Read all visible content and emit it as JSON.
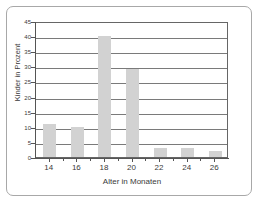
{
  "chart_data": {
    "type": "bar",
    "title": "",
    "xlabel": "Alter in Monaten",
    "ylabel": "Kinder in Prozent",
    "categories": [
      "14",
      "16",
      "18",
      "20",
      "22",
      "24",
      "26"
    ],
    "values": [
      11,
      10,
      40,
      29,
      3,
      3,
      2
    ],
    "series": [
      {
        "name": "Kinder in Prozent",
        "values": [
          11,
          10,
          40,
          29,
          3,
          3,
          2
        ]
      }
    ],
    "ylim": [
      0,
      45
    ],
    "xlim": [
      13,
      27
    ],
    "ytick_labels": [
      "0",
      "5",
      "10",
      "15",
      "20",
      "25",
      "30",
      "35",
      "40",
      "45"
    ],
    "ytick_values": [
      0,
      5,
      10,
      15,
      20,
      25,
      30,
      35,
      40,
      45
    ],
    "xtick_labels": [
      "14",
      "16",
      "18",
      "20",
      "22",
      "24",
      "26"
    ],
    "grid": "horizontal",
    "legend": "none",
    "bar_color": "#d2d2d2",
    "axis_color": "#555555",
    "grid_color": "#7a7a7a",
    "frame_color": "#a8a8a8",
    "text_color": "#3a3a3a"
  }
}
